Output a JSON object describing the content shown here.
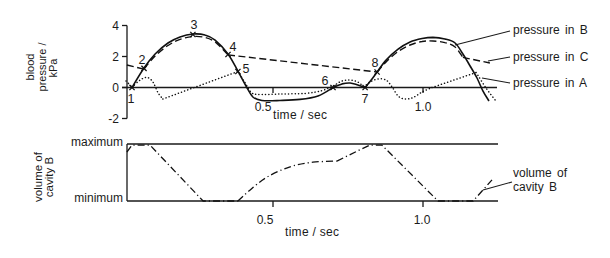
{
  "chart_data": [
    {
      "type": "line",
      "title": "",
      "xlabel": "time / sec",
      "ylabel": "blood pressure / kPa",
      "ylabel_lines": [
        "blood",
        "pressure /",
        "kPa"
      ],
      "xlim": [
        0,
        1.25
      ],
      "ylim": [
        -2,
        4
      ],
      "xticks": [
        0.5,
        1.0
      ],
      "xtick_labels": [
        "0.5",
        "1.0"
      ],
      "yticks": [
        4,
        2,
        0,
        -2
      ],
      "ytick_labels": [
        "4",
        "2",
        "0",
        "-2"
      ],
      "grid": false,
      "legend_position": "right",
      "series": [
        {
          "name": "pressure in B",
          "style": "solid",
          "segments": [
            {
              "smooth": true,
              "points": [
                [
                  0.03,
                  0
                ],
                [
                  0.07,
                  1.26
                ],
                [
                  0.107,
                  2.16
                ],
                [
                  0.15,
                  2.87
                ],
                [
                  0.19,
                  3.26
                ],
                [
                  0.233,
                  3.45
                ],
                [
                  0.273,
                  3.39
                ],
                [
                  0.307,
                  3.06
                ],
                [
                  0.35,
                  2.16
                ],
                [
                  0.383,
                  1.06
                ],
                [
                  0.41,
                  0.1
                ],
                [
                  0.433,
                  -0.61
                ],
                [
                  0.463,
                  -0.84
                ],
                [
                  0.523,
                  -0.84
                ],
                [
                  0.59,
                  -0.77
                ],
                [
                  0.65,
                  -0.55
                ],
                [
                  0.7,
                  0
                ]
              ]
            },
            {
              "smooth": true,
              "points": [
                [
                  0.7,
                  0
                ],
                [
                  0.73,
                  0.23
                ],
                [
                  0.757,
                  0.29
                ],
                [
                  0.783,
                  0.16
                ],
                [
                  0.807,
                  0
                ]
              ]
            },
            {
              "smooth": true,
              "points": [
                [
                  0.807,
                  0
                ],
                [
                  0.83,
                  0.55
                ],
                [
                  0.847,
                  1.0
                ],
                [
                  0.877,
                  1.77
                ],
                [
                  0.917,
                  2.48
                ],
                [
                  0.957,
                  2.94
                ],
                [
                  0.997,
                  3.16
                ],
                [
                  1.033,
                  3.23
                ],
                [
                  1.073,
                  3.13
                ],
                [
                  1.107,
                  2.87
                ],
                [
                  1.133,
                  2.16
                ],
                [
                  1.157,
                  1.39
                ],
                [
                  1.18,
                  0.61
                ],
                [
                  1.2,
                  -0.23
                ],
                [
                  1.22,
                  -0.87
                ]
              ]
            }
          ]
        },
        {
          "name": "pressure in C",
          "style": "dashed",
          "segments": [
            {
              "smooth": false,
              "points": [
                [
                  0.013,
                  1.45
                ],
                [
                  0.07,
                  1.19
                ]
              ]
            },
            {
              "smooth": true,
              "points": [
                [
                  0.07,
                  1.19
                ],
                [
                  0.107,
                  2.03
                ],
                [
                  0.15,
                  2.71
                ],
                [
                  0.19,
                  3.1
                ],
                [
                  0.233,
                  3.29
                ],
                [
                  0.273,
                  3.23
                ],
                [
                  0.31,
                  2.9
                ],
                [
                  0.35,
                  2.1
                ]
              ]
            },
            {
              "smooth": false,
              "points": [
                [
                  0.35,
                  2.1
                ],
                [
                  0.847,
                  1.0
                ]
              ]
            },
            {
              "smooth": true,
              "points": [
                [
                  0.847,
                  1.0
                ],
                [
                  0.877,
                  1.65
                ],
                [
                  0.917,
                  2.32
                ],
                [
                  0.957,
                  2.74
                ],
                [
                  0.997,
                  2.97
                ],
                [
                  1.033,
                  3.0
                ],
                [
                  1.073,
                  2.9
                ],
                [
                  1.107,
                  2.61
                ],
                [
                  1.133,
                  1.94
                ]
              ]
            },
            {
              "smooth": false,
              "points": [
                [
                  1.133,
                  1.94
                ],
                [
                  1.223,
                  1.58
                ]
              ]
            }
          ]
        },
        {
          "name": "pressure in A",
          "style": "dotted",
          "segments": [
            {
              "smooth": false,
              "points": [
                [
                  0.01,
                  0.42
                ],
                [
                  0.03,
                  0.03
                ]
              ]
            },
            {
              "smooth": true,
              "points": [
                [
                  0.03,
                  0.03
                ],
                [
                  0.057,
                  0.48
                ],
                [
                  0.08,
                  0.65
                ],
                [
                  0.1,
                  0.35
                ],
                [
                  0.117,
                  -0.35
                ],
                [
                  0.133,
                  -0.74
                ]
              ]
            },
            {
              "smooth": false,
              "points": [
                [
                  0.133,
                  -0.74
                ],
                [
                  0.383,
                  1.03
                ]
              ]
            },
            {
              "smooth": true,
              "points": [
                [
                  0.383,
                  1.03
                ],
                [
                  0.407,
                  0.3
                ],
                [
                  0.427,
                  -0.3
                ],
                [
                  0.45,
                  -0.45
                ],
                [
                  0.523,
                  -0.42
                ],
                [
                  0.607,
                  -0.38
                ],
                [
                  0.663,
                  -0.2
                ],
                [
                  0.7,
                  0.1
                ],
                [
                  0.73,
                  0.42
                ],
                [
                  0.757,
                  0.48
                ],
                [
                  0.783,
                  0.35
                ],
                [
                  0.803,
                  0.03
                ]
              ]
            },
            {
              "smooth": true,
              "points": [
                [
                  0.803,
                  0.03
                ],
                [
                  0.823,
                  0.35
                ],
                [
                  0.85,
                  0.55
                ],
                [
                  0.877,
                  0.48
                ],
                [
                  0.897,
                  0.03
                ],
                [
                  0.917,
                  -0.55
                ],
                [
                  0.94,
                  -0.74
                ],
                [
                  0.967,
                  -0.65
                ],
                [
                  0.997,
                  -0.29
                ],
                [
                  1.03,
                  0
                ]
              ]
            },
            {
              "smooth": false,
              "points": [
                [
                  1.03,
                  0
                ],
                [
                  1.177,
                  0.97
                ]
              ]
            },
            {
              "smooth": true,
              "points": [
                [
                  1.177,
                  0.97
                ],
                [
                  1.21,
                  -0.03
                ],
                [
                  1.243,
                  -0.87
                ]
              ]
            }
          ]
        }
      ],
      "annotations": [
        {
          "label": "1",
          "x": 0.03,
          "y": 0,
          "marker": "x",
          "label_offset": [
            -1,
            11
          ]
        },
        {
          "label": "2",
          "x": 0.07,
          "y": 1.23,
          "marker": "x",
          "label_offset": [
            -2,
            -8.5
          ]
        },
        {
          "label": "3",
          "x": 0.233,
          "y": 3.42,
          "marker": "x",
          "label_offset": [
            1,
            -10
          ]
        },
        {
          "label": "4",
          "x": 0.35,
          "y": 2.13,
          "marker": "x",
          "label_offset": [
            5,
            -8
          ]
        },
        {
          "label": "5",
          "x": 0.383,
          "y": 1.03,
          "marker": "x",
          "label_offset": [
            8,
            -3
          ]
        },
        {
          "label": "6",
          "x": 0.7,
          "y": 0,
          "marker": "x",
          "label_offset": [
            -8,
            -7
          ]
        },
        {
          "label": "7",
          "x": 0.807,
          "y": 0,
          "marker": "x",
          "label_offset": [
            0,
            11
          ]
        },
        {
          "label": "8",
          "x": 0.847,
          "y": 1.0,
          "marker": "x",
          "label_offset": [
            -2,
            -9.5
          ]
        }
      ]
    },
    {
      "type": "line",
      "title": "",
      "xlabel": "time / sec",
      "ylabel": "volume of cavity B",
      "ylabel_lines": [
        "volume of",
        "cavity  B"
      ],
      "xlim": [
        0,
        1.25
      ],
      "ylim": [
        0,
        1
      ],
      "xticks": [
        0.5,
        1.0
      ],
      "xtick_labels": [
        "0.5",
        "1.0"
      ],
      "yticks": [
        0,
        1
      ],
      "ytick_labels": [
        "minimum",
        "maximum"
      ],
      "grid": false,
      "series": [
        {
          "name": "volume of cavity B",
          "label_lines": [
            "volume of",
            "cavity B"
          ],
          "style": "dash-dot",
          "segments": [
            {
              "smooth": false,
              "points": [
                [
                  0.013,
                  0.86
                ],
                [
                  0.03,
                  0.98
                ],
                [
                  0.09,
                  0.98
                ],
                [
                  0.267,
                  0
                ],
                [
                  0.383,
                  0
                ]
              ]
            },
            {
              "smooth": true,
              "points": [
                [
                  0.383,
                  0
                ],
                [
                  0.423,
                  0.19
                ],
                [
                  0.48,
                  0.42
                ],
                [
                  0.557,
                  0.6
                ],
                [
                  0.633,
                  0.68
                ],
                [
                  0.713,
                  0.7
                ]
              ]
            },
            {
              "smooth": false,
              "points": [
                [
                  0.713,
                  0.7
                ],
                [
                  0.79,
                  0.9
                ],
                [
                  0.823,
                  0.98
                ],
                [
                  0.863,
                  0.98
                ],
                [
                  1.05,
                  0
                ],
                [
                  1.167,
                  0
                ],
                [
                  1.23,
                  0.37
                ]
              ]
            }
          ]
        }
      ]
    }
  ]
}
